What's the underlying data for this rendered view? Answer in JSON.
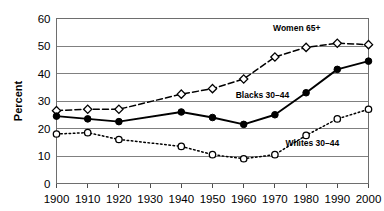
{
  "chart_data": {
    "type": "line",
    "title": "",
    "xlabel": "",
    "ylabel": "Percent",
    "x": [
      1900,
      1910,
      1920,
      1930,
      1940,
      1950,
      1960,
      1970,
      1980,
      1990,
      2000
    ],
    "xtick_labels": [
      "1900",
      "1910",
      "1920",
      "1930",
      "1940",
      "1950",
      "1960",
      "1970",
      "1980",
      "1990",
      "2000"
    ],
    "ytick_labels": [
      "0",
      "10",
      "20",
      "30",
      "40",
      "50",
      "60"
    ],
    "yticks": [
      0,
      10,
      20,
      30,
      40,
      50,
      60
    ],
    "xlim": [
      1900,
      2000
    ],
    "ylim": [
      0,
      60
    ],
    "grid": "horizontal",
    "legend_position": "inline-annotations",
    "series": [
      {
        "name": "Women 65+",
        "label": "Women 65+",
        "marker": "open-diamond",
        "linestyle": "dashed",
        "color": "#000000",
        "values": [
          26.5,
          27.0,
          27.0,
          null,
          32.5,
          34.5,
          38.0,
          46.0,
          49.5,
          51.0,
          50.5
        ],
        "label_x": 1977,
        "label_y": 55.5
      },
      {
        "name": "Blacks 30-44",
        "label": "Blacks 30–44",
        "marker": "filled-circle",
        "linestyle": "solid",
        "color": "#000000",
        "values": [
          24.5,
          23.5,
          22.5,
          null,
          26.0,
          24.0,
          21.5,
          25.0,
          33.0,
          41.5,
          44.5
        ],
        "label_x": 1966,
        "label_y": 31.0
      },
      {
        "name": "Whites 30-44",
        "label": "Whites 30–44",
        "marker": "open-circle",
        "linestyle": "dotted",
        "color": "#000000",
        "values": [
          18.0,
          18.5,
          16.0,
          null,
          13.5,
          10.5,
          9.0,
          10.5,
          17.5,
          23.5,
          27.0
        ],
        "label_x": 1982,
        "label_y": 13.5
      }
    ]
  }
}
